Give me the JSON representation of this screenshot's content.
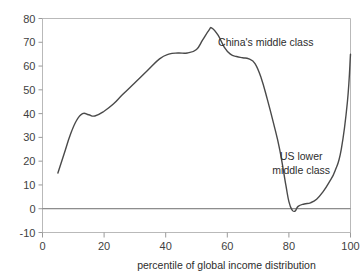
{
  "chart_data": {
    "type": "line",
    "title": "",
    "xlabel": "percentile of  global income distribution",
    "ylabel": "",
    "xlim": [
      0,
      100
    ],
    "ylim": [
      -10,
      80
    ],
    "grid": false,
    "legend": "none",
    "x_ticks": [
      "0",
      "20",
      "40",
      "60",
      "80",
      "100"
    ],
    "x_tick_values": [
      0,
      20,
      40,
      60,
      80,
      100
    ],
    "y_ticks": [
      "-10",
      "0",
      "10",
      "20",
      "30",
      "40",
      "50",
      "60",
      "70",
      "80"
    ],
    "y_tick_values": [
      -10,
      0,
      10,
      20,
      30,
      40,
      50,
      60,
      70,
      80
    ],
    "series": [
      {
        "name": "real income growth",
        "x": [
          5,
          7,
          9,
          11,
          13,
          15,
          17,
          20,
          23,
          26,
          30,
          34,
          38,
          41,
          44,
          47,
          50,
          52,
          54,
          55,
          57,
          59,
          61,
          63,
          65,
          67,
          69,
          71,
          73,
          75,
          77,
          79,
          80,
          81,
          82,
          83,
          85,
          87,
          89,
          91,
          93,
          95,
          97,
          99,
          100
        ],
        "values": [
          15,
          23,
          31,
          37,
          40,
          39.5,
          39,
          41,
          44,
          48,
          53,
          58,
          63,
          65,
          65.5,
          65.5,
          67,
          71,
          75,
          76,
          73,
          68,
          65,
          64,
          63.5,
          63,
          61,
          55,
          46,
          36,
          25,
          10,
          3,
          -0.5,
          -1,
          1,
          2,
          2.5,
          4,
          7,
          11,
          16,
          25,
          45,
          65
        ]
      }
    ],
    "annotations": [
      {
        "id": "china-middle-class",
        "text": "China's middle class",
        "lines": [
          "China's middle class"
        ],
        "x": 57,
        "y": 70
      },
      {
        "id": "us-lower-middle-class",
        "text": "US lower middle class",
        "lines": [
          "US lower",
          "middle class"
        ],
        "x": 84,
        "y": 22
      }
    ]
  },
  "axis": {
    "x_title": "percentile of  global income distribution"
  },
  "colors": {
    "curve": "#4a4a4a",
    "frame": "#b9b9b9",
    "zero_line": "#6e6e6e",
    "text": "#2d2d2d",
    "background": "#ffffff"
  }
}
